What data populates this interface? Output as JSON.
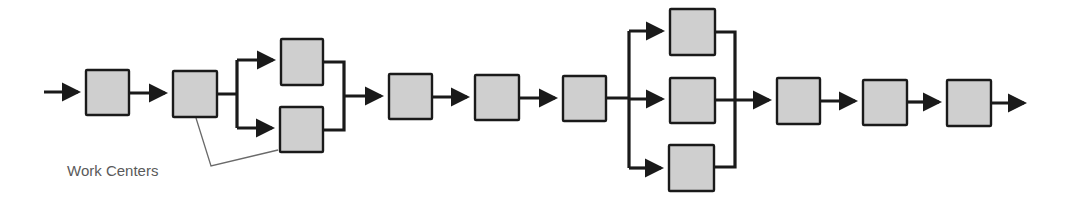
{
  "diagram": {
    "type": "process-flow",
    "colors": {
      "box_fill": "#cfcfcf",
      "stroke": "#1a1a1a",
      "label": "#5a5a5a",
      "leader": "#6a6a6a"
    },
    "nodes": [
      {
        "id": "wc1",
        "x": 86,
        "y": 70,
        "w": 43,
        "h": 45
      },
      {
        "id": "wc2",
        "x": 173,
        "y": 71,
        "w": 44,
        "h": 46
      },
      {
        "id": "wc3a",
        "x": 281,
        "y": 39,
        "w": 42,
        "h": 46
      },
      {
        "id": "wc3b",
        "x": 280,
        "y": 107,
        "w": 43,
        "h": 45
      },
      {
        "id": "wc4",
        "x": 389,
        "y": 74,
        "w": 43,
        "h": 45
      },
      {
        "id": "wc5",
        "x": 475,
        "y": 75,
        "w": 44,
        "h": 45
      },
      {
        "id": "wc6",
        "x": 563,
        "y": 76,
        "w": 43,
        "h": 45
      },
      {
        "id": "wc7a",
        "x": 670,
        "y": 9,
        "w": 45,
        "h": 46
      },
      {
        "id": "wc7b",
        "x": 670,
        "y": 78,
        "w": 45,
        "h": 45
      },
      {
        "id": "wc7c",
        "x": 669,
        "y": 145,
        "w": 45,
        "h": 46
      },
      {
        "id": "wc8",
        "x": 777,
        "y": 78,
        "w": 43,
        "h": 46
      },
      {
        "id": "wc9",
        "x": 863,
        "y": 80,
        "w": 44,
        "h": 45
      },
      {
        "id": "wc10",
        "x": 947,
        "y": 80,
        "w": 44,
        "h": 46
      }
    ],
    "annotation": {
      "label": "Work Centers",
      "x": 67,
      "y": 162
    }
  }
}
